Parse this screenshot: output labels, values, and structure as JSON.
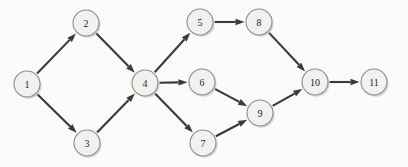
{
  "diagram": {
    "background_color": "#fbfbfa",
    "node_fill_color": "#f2f1ef",
    "node_stroke_color": "#8d8d8d",
    "edge_color": "#3a3a3a",
    "label_color": "#1d1d1d",
    "node_radius": 13,
    "nodes": [
      {
        "id": "1",
        "label": "1",
        "cx": 27,
        "cy": 84
      },
      {
        "id": "2",
        "label": "2",
        "cx": 86,
        "cy": 23
      },
      {
        "id": "3",
        "label": "3",
        "cx": 87,
        "cy": 143
      },
      {
        "id": "4",
        "label": "4",
        "cx": 145,
        "cy": 83
      },
      {
        "id": "5",
        "label": "5",
        "cx": 200,
        "cy": 22
      },
      {
        "id": "6",
        "label": "6",
        "cx": 202,
        "cy": 82
      },
      {
        "id": "7",
        "label": "7",
        "cx": 203,
        "cy": 143
      },
      {
        "id": "8",
        "label": "8",
        "cx": 259,
        "cy": 22
      },
      {
        "id": "9",
        "label": "9",
        "cx": 260,
        "cy": 113
      },
      {
        "id": "10",
        "label": "10",
        "cx": 315,
        "cy": 82
      },
      {
        "id": "11",
        "label": "11",
        "cx": 374,
        "cy": 82
      }
    ],
    "edges": [
      {
        "from": "1",
        "to": "2",
        "directed": true
      },
      {
        "from": "1",
        "to": "3",
        "directed": true
      },
      {
        "from": "2",
        "to": "4",
        "directed": true
      },
      {
        "from": "3",
        "to": "4",
        "directed": true
      },
      {
        "from": "4",
        "to": "5",
        "directed": true
      },
      {
        "from": "4",
        "to": "6",
        "directed": true
      },
      {
        "from": "4",
        "to": "7",
        "directed": true
      },
      {
        "from": "5",
        "to": "8",
        "directed": true
      },
      {
        "from": "6",
        "to": "9",
        "directed": true
      },
      {
        "from": "7",
        "to": "9",
        "directed": true
      },
      {
        "from": "8",
        "to": "10",
        "directed": true
      },
      {
        "from": "9",
        "to": "10",
        "directed": true
      },
      {
        "from": "10",
        "to": "11",
        "directed": true
      }
    ]
  }
}
